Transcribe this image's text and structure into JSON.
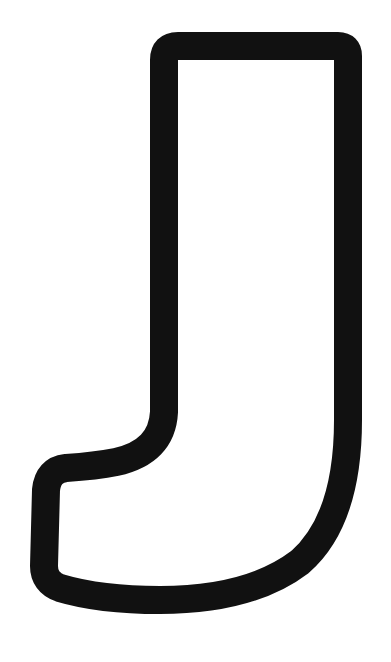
{
  "image": {
    "subject": "outlined letter",
    "letter": "J",
    "colors": {
      "background": "#ffffff",
      "outline": "#111111",
      "fill": "#ffffff"
    }
  }
}
